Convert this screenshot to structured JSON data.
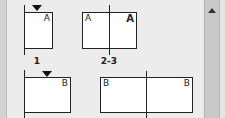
{
  "pages_panel": {
    "spreads": [
      {
        "label": "1",
        "pages": [
          {
            "master": "A",
            "current": true
          }
        ]
      },
      {
        "label": "2-3",
        "pages": [
          {
            "master": "A"
          },
          {
            "master": "A",
            "master_bold": true
          }
        ]
      }
    ],
    "row2": [
      {
        "pages": [
          {
            "master": "B",
            "current": true
          }
        ]
      },
      {
        "pages": [
          {
            "master": "B"
          },
          {
            "master": "B"
          }
        ]
      }
    ]
  },
  "scrollbar": {
    "up_icon": "triangle-up"
  }
}
